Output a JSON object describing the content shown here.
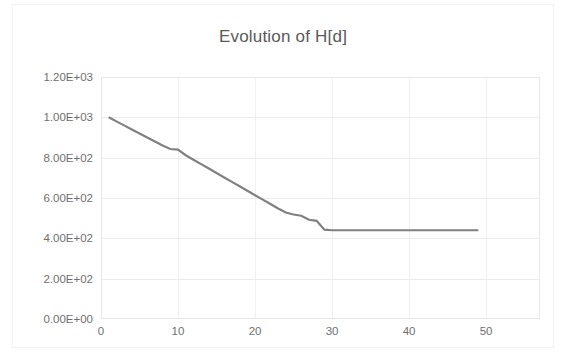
{
  "chart_data": {
    "type": "line",
    "title": "Evolution of H[d]",
    "xlabel": "",
    "ylabel": "",
    "xlim": [
      0,
      57
    ],
    "ylim": [
      0,
      1200
    ],
    "grid": true,
    "legend": "none",
    "line_color": "#808080",
    "xticks": [
      "0",
      "10",
      "20",
      "30",
      "40",
      "50"
    ],
    "xtick_values": [
      0,
      10,
      20,
      30,
      40,
      50
    ],
    "yticks": [
      "0.00E+00",
      "2.00E+02",
      "4.00E+02",
      "6.00E+02",
      "8.00E+02",
      "1.00E+03",
      "1.20E+03"
    ],
    "ytick_values": [
      0,
      200,
      400,
      600,
      800,
      1000,
      1200
    ],
    "series": [
      {
        "name": "H[d]",
        "x": [
          1,
          2,
          3,
          4,
          5,
          6,
          7,
          8,
          9,
          10,
          11,
          12,
          13,
          14,
          15,
          16,
          17,
          18,
          19,
          20,
          21,
          22,
          23,
          24,
          25,
          26,
          27,
          28,
          29,
          30,
          31,
          32,
          33,
          34,
          35,
          36,
          37,
          38,
          39,
          40,
          41,
          42,
          43,
          44,
          45,
          46,
          47,
          48,
          49
        ],
        "values": [
          1000,
          980,
          960,
          940,
          920,
          900,
          880,
          860,
          843,
          840,
          812,
          790,
          768,
          746,
          724,
          702,
          680,
          658,
          636,
          614,
          592,
          570,
          548,
          528,
          518,
          512,
          492,
          487,
          443,
          440,
          440,
          440,
          440,
          440,
          440,
          440,
          440,
          440,
          440,
          440,
          440,
          440,
          440,
          440,
          440,
          440,
          440,
          440,
          440
        ]
      }
    ]
  }
}
